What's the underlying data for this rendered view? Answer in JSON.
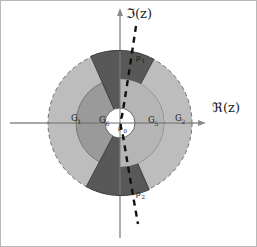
{
  "figure": {
    "canvas": {
      "width": 257,
      "height": 247,
      "background": "#ffffff"
    },
    "border": {
      "color": "#b9b9b9",
      "width": 1
    },
    "axes": {
      "origin": {
        "x": 120,
        "y": 123
      },
      "real": {
        "label": "ℜ(z)",
        "label_x": 212,
        "label_y": 112,
        "line_color": "#8a8a8a",
        "x_start": 8,
        "x_end": 205,
        "arrow": "right"
      },
      "imaginary": {
        "label": "ℑ(z)",
        "label_x": 126,
        "label_y": 18,
        "line_color": "#8a8a8a",
        "y_start": 10,
        "y_end": 238,
        "arrow": "up"
      }
    },
    "circles": {
      "outer": {
        "radius": 72,
        "fill": "#bdbdbd",
        "stroke": "#6e6e6e",
        "dashed": true,
        "dash_pattern": "4 3"
      },
      "middle": {
        "radius": 44,
        "fill": "#9a9a9a",
        "stroke": "#6e6e6e",
        "dashed": false
      },
      "inner": {
        "radius": 15,
        "fill": "#ffffff",
        "stroke": "#5a5a5a",
        "dashed": false
      }
    },
    "wedges": {
      "fill": "#585858",
      "stroke": "#3a3a3a",
      "top": {
        "label": "ρ",
        "label_sub": "1",
        "label_x": 136,
        "label_y": 60,
        "start_angle_deg": 62,
        "end_angle_deg": 114
      },
      "bottom": {
        "label": "ρ",
        "label_sub": "2",
        "label_x": 136,
        "label_y": 196,
        "start_angle_deg": 242,
        "end_angle_deg": 294
      }
    },
    "dashed_curve": {
      "color": "#111111",
      "width": 2.4,
      "dash_pattern": "6 5",
      "points": [
        {
          "x": 136,
          "y": 26
        },
        {
          "x": 131,
          "y": 62
        },
        {
          "x": 126,
          "y": 96
        },
        {
          "x": 122,
          "y": 116
        },
        {
          "x": 120,
          "y": 124
        },
        {
          "x": 123,
          "y": 136
        },
        {
          "x": 128,
          "y": 158
        },
        {
          "x": 133,
          "y": 190
        },
        {
          "x": 138,
          "y": 224
        }
      ]
    },
    "region_labels": [
      {
        "name": "g1",
        "text": "G",
        "sub": "1",
        "x": 71,
        "y": 121,
        "ring": "outer-left"
      },
      {
        "name": "g6",
        "text": "G",
        "sub": "6",
        "x": 99,
        "y": 123,
        "ring": "middle-left"
      },
      {
        "name": "g5",
        "text": "G",
        "sub": "5",
        "x": 148,
        "y": 123,
        "ring": "middle-right"
      },
      {
        "name": "g2",
        "text": "G",
        "sub": "2",
        "x": 175,
        "y": 121,
        "ring": "outer-right"
      }
    ],
    "center_label": {
      "text": "ρ",
      "sub": "0",
      "x": 121,
      "y": 130
    }
  }
}
